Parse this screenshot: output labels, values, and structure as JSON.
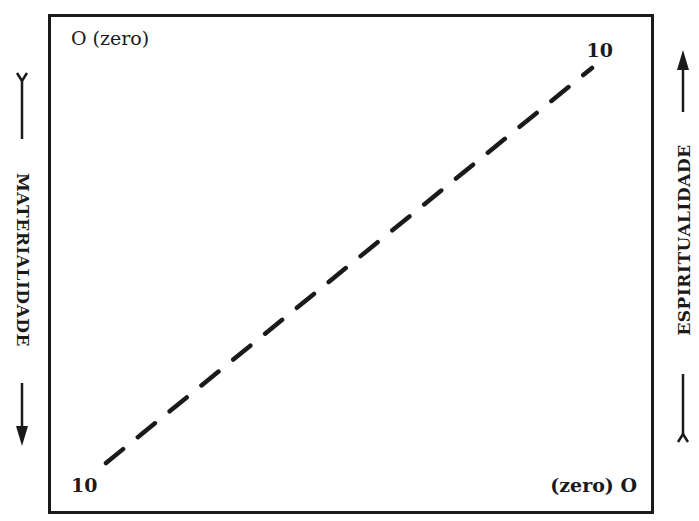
{
  "diagram": {
    "type": "scale-diagram",
    "corners": {
      "top_left": "O (zero)",
      "top_right": "10",
      "bottom_left": "10",
      "bottom_right": "(zero) O"
    },
    "axes": {
      "left": {
        "label": "MATERIALIDADE",
        "direction": "down",
        "from": "O (zero)",
        "to": "10"
      },
      "right": {
        "label": "ESPIRITUALIDADE",
        "direction": "up",
        "from": "(zero) O",
        "to": "10"
      }
    },
    "line": {
      "style": "dashed",
      "from_corner": "bottom_left",
      "to_corner": "top_right"
    },
    "colors": {
      "ink": "#1a1a1a",
      "background": "#ffffff"
    }
  }
}
